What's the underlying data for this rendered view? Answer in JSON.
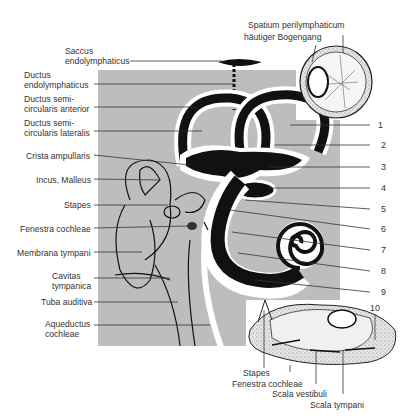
{
  "diagram": {
    "colors": {
      "background": "#ffffff",
      "panel": "#bdbdbd",
      "ink": "#111111",
      "label": "#333333",
      "inset": "#e8e8e8"
    },
    "left_labels": [
      {
        "id": "saccus",
        "line1": "Saccus",
        "line2": "endolymphaticus"
      },
      {
        "id": "ductus-endo",
        "line1": "Ductus",
        "line2": "endolymphaticus"
      },
      {
        "id": "ductus-anterior",
        "line1": "Ductus semi-",
        "line2": "circularis anterior"
      },
      {
        "id": "ductus-lateralis",
        "line1": "Ductus semi-",
        "line2": "circularis lateralis"
      },
      {
        "id": "crista",
        "line1": "Crista ampullaris",
        "line2": ""
      },
      {
        "id": "incus",
        "line1": "Incus, Malleus",
        "line2": ""
      },
      {
        "id": "stapes",
        "line1": "Stapes",
        "line2": ""
      },
      {
        "id": "fenestra",
        "line1": "Fenestra cochleae",
        "line2": ""
      },
      {
        "id": "membrana",
        "line1": "Membrana tympani",
        "line2": ""
      },
      {
        "id": "cavitas",
        "line1": "Cavitas",
        "line2": "tympanica"
      },
      {
        "id": "tuba",
        "line1": "Tuba auditiva",
        "line2": ""
      },
      {
        "id": "aqueductus",
        "line1": "Aqueductus",
        "line2": "cochleae"
      }
    ],
    "right_numbers": [
      "1",
      "2",
      "3",
      "4",
      "5",
      "6",
      "7",
      "8",
      "9",
      "10"
    ],
    "inset_top": {
      "label1": "Spatium perilymphaticum",
      "label2": "häutiger Bogengang"
    },
    "inset_bottom": {
      "labels": [
        "Stapes",
        "Fenestra cochleae",
        "Scala vestibuli",
        "Scala tympani"
      ]
    }
  }
}
